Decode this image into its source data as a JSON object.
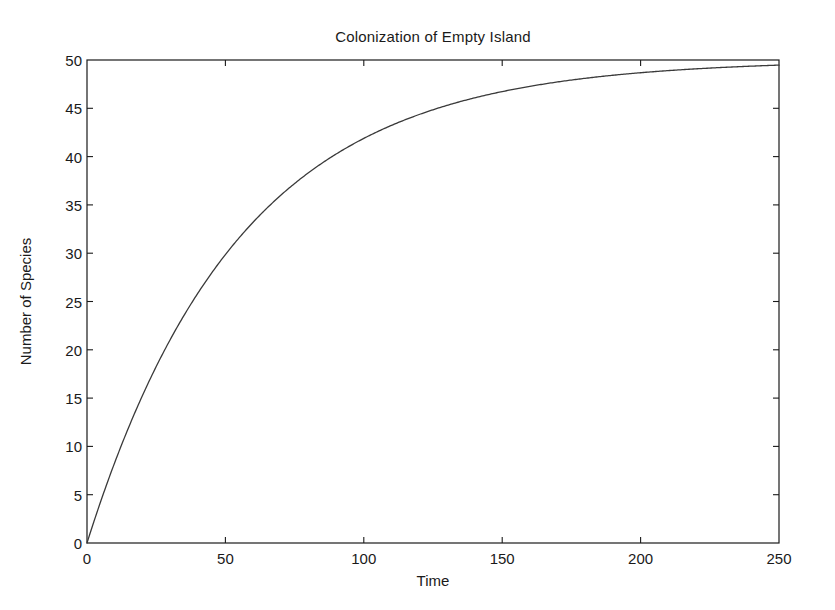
{
  "figure": {
    "background_color": "#ffffff",
    "axis_color": "#1a1a1a",
    "line_color": "#3a3a3a"
  },
  "chart_data": {
    "type": "line",
    "title": "Colonization of Empty Island",
    "xlabel": "Time",
    "ylabel": "Number of Species",
    "xlim": [
      0,
      250
    ],
    "ylim": [
      0,
      50
    ],
    "grid": false,
    "legend": null,
    "xticks": [
      0,
      50,
      100,
      150,
      200,
      250
    ],
    "xtick_labels": [
      "0",
      "50",
      "100",
      "150",
      "200",
      "250"
    ],
    "yticks": [
      0,
      5,
      10,
      15,
      20,
      25,
      30,
      35,
      40,
      45,
      50
    ],
    "ytick_labels": [
      "0",
      "5",
      "10",
      "15",
      "20",
      "25",
      "30",
      "35",
      "40",
      "45",
      "50"
    ],
    "series": [
      {
        "name": "Number of Species",
        "model": "S(t) = 50 * (1 - exp(-t / 55))",
        "equilibrium": 50,
        "x": [
          0,
          5,
          10,
          15,
          20,
          25,
          30,
          35,
          40,
          45,
          50,
          60,
          70,
          80,
          90,
          100,
          110,
          120,
          130,
          140,
          150,
          160,
          170,
          180,
          190,
          200,
          210,
          220,
          230,
          240,
          250
        ],
        "values": [
          0.0,
          4.34,
          8.31,
          11.93,
          15.24,
          18.26,
          21.02,
          23.55,
          25.85,
          27.96,
          29.88,
          33.23,
          36.03,
          38.38,
          40.35,
          41.99,
          43.37,
          44.52,
          45.49,
          46.3,
          46.98,
          47.55,
          48.03,
          48.43,
          48.76,
          49.04,
          49.28,
          49.48,
          49.65,
          49.79,
          49.9
        ]
      }
    ]
  }
}
